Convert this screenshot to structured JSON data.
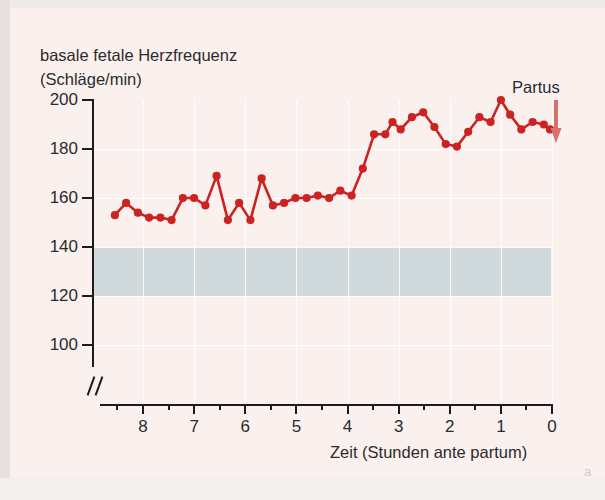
{
  "figure": {
    "corner_label": "a",
    "background_color": "#faf1ef",
    "series_color": "#cc2222",
    "band_color": "#ccd8da"
  },
  "title": {
    "line1": "basale fetale Herzfrequenz",
    "line2": "(Schläge/min)"
  },
  "annotation": {
    "partus_label": "Partus",
    "arrow_icon": "down-arrow-icon"
  },
  "chart_data": {
    "type": "line",
    "title": "basale fetale Herzfrequenz (Schläge/min)",
    "xlabel": "Zeit (Stunden ante partum)",
    "ylabel": "basale fetale Herzfrequenz (Schläge/min)",
    "xlim": [
      8.7,
      -0.05
    ],
    "ylim": [
      95,
      203
    ],
    "x_ticks": [
      8,
      7,
      6,
      5,
      4,
      3,
      2,
      1,
      0
    ],
    "x_tick_labels": [
      "8",
      "7",
      "6",
      "5",
      "4",
      "3",
      "2",
      "1",
      "0"
    ],
    "x_minor_ticks": [
      8.5,
      7.5,
      6.5,
      5.5,
      4.5,
      3.5,
      2.5,
      1.5,
      0.5
    ],
    "y_ticks": [
      200,
      180,
      160,
      140,
      120,
      100
    ],
    "y_tick_labels": [
      "200",
      "180",
      "160",
      "140",
      "120",
      "100"
    ],
    "axis_break_x": true,
    "axis_break_y": true,
    "grid": true,
    "legend": "none",
    "normal_band": {
      "label": "Normbereich",
      "y_min": 120,
      "y_max": 140
    },
    "series": [
      {
        "name": "basale fetale Herzfrequenz",
        "color": "#cc2222",
        "marker": "circle",
        "x": [
          8.55,
          8.33,
          8.1,
          7.88,
          7.66,
          7.44,
          7.22,
          7.0,
          6.78,
          6.56,
          6.34,
          6.12,
          5.9,
          5.68,
          5.46,
          5.24,
          5.02,
          4.8,
          4.58,
          4.36,
          4.14,
          3.92,
          3.7,
          3.48,
          3.26,
          3.12,
          2.96,
          2.74,
          2.52,
          2.3,
          2.08,
          1.86,
          1.64,
          1.42,
          1.2,
          1.0,
          0.82,
          0.6,
          0.38,
          0.16,
          0.04
        ],
        "y": [
          153,
          158,
          154,
          152,
          152,
          151,
          160,
          160,
          157,
          169,
          151,
          158,
          151,
          168,
          157,
          158,
          160,
          160,
          161,
          160,
          163,
          161,
          172,
          186,
          186,
          191,
          188,
          193,
          195,
          189,
          182,
          181,
          187,
          193,
          191,
          200,
          194,
          188,
          191,
          190,
          188
        ]
      }
    ]
  },
  "axis": {
    "x_caption": "Zeit (Stunden ante partum)"
  }
}
